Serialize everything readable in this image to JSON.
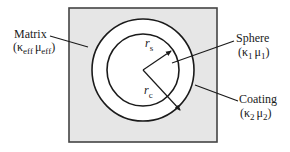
{
  "diagram": {
    "type": "coated-sphere-schematic",
    "colors": {
      "matrix_fill": "#e6e6e6",
      "coating_fill": "#ffffff",
      "sphere_fill": "#ffffff",
      "stroke": "#1a1a1a"
    },
    "matrix": {
      "name": "Matrix",
      "props": {
        "open": "(",
        "k": "κ",
        "k_sub": "eff",
        "mu": "μ",
        "mu_sub": "eff",
        "close": ")"
      }
    },
    "sphere": {
      "name": "Sphere",
      "props": {
        "open": "(",
        "k": "κ",
        "k_sub": "1",
        "mu": "μ",
        "mu_sub": "1",
        "close": ")"
      }
    },
    "coating": {
      "name": "Coating",
      "props": {
        "open": "(",
        "k": "κ",
        "k_sub": "2",
        "mu": "μ",
        "mu_sub": "2",
        "close": ")"
      }
    },
    "radii": {
      "sphere": {
        "symbol": "r",
        "sub": "s"
      },
      "coating": {
        "symbol": "r",
        "sub": "c"
      }
    }
  }
}
